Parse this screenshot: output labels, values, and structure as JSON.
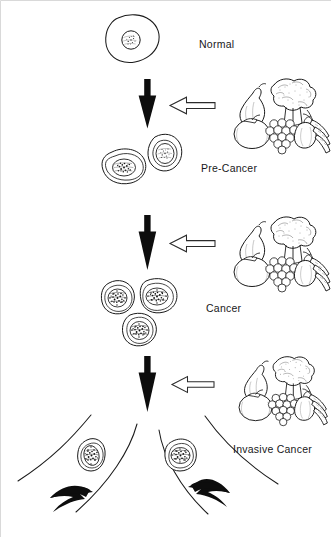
{
  "figure": {
    "width": 331,
    "height": 537,
    "background_color": "#ffffff",
    "ink_color": "#111111",
    "border_color": "#d9d9d9"
  },
  "stages": [
    {
      "id": "normal",
      "label": "Normal",
      "cell_count": 1,
      "cell_description": "single normal cell with round nucleus",
      "label_x": 199,
      "label_y": 39
    },
    {
      "id": "pre-cancer",
      "label": "Pre-Cancer",
      "cell_count": 2,
      "cell_description": "two cells with irregular speckled nuclei",
      "label_x": 201,
      "label_y": 163
    },
    {
      "id": "cancer",
      "label": "Cancer",
      "cell_count": 3,
      "cell_description": "three cells with dense dark irregular nuclei",
      "label_x": 206,
      "label_y": 303
    },
    {
      "id": "invasive-cancer",
      "label": "Invasive Cancer",
      "cell_count": 2,
      "cell_description": "two cells migrating outward through diverging channels",
      "label_x": 233,
      "label_y": 444
    }
  ],
  "progression_arrows": [
    {
      "id": "arrow-normal-to-precancer",
      "icon": "down-arrow-icon",
      "direction": "down",
      "style": "solid-black"
    },
    {
      "id": "arrow-precancer-to-cancer",
      "icon": "down-arrow-icon",
      "direction": "down",
      "style": "solid-black"
    },
    {
      "id": "arrow-cancer-to-invasive",
      "icon": "down-arrow-icon",
      "direction": "down",
      "style": "solid-black"
    }
  ],
  "intervention_arrows": [
    {
      "id": "diet-arrow-1",
      "icon": "left-arrow-outline-icon",
      "direction": "left",
      "style": "hollow-outline"
    },
    {
      "id": "diet-arrow-2",
      "icon": "left-arrow-outline-icon",
      "direction": "left",
      "style": "hollow-outline"
    },
    {
      "id": "diet-arrow-3",
      "icon": "left-arrow-outline-icon",
      "direction": "left",
      "style": "hollow-outline"
    }
  ],
  "food_clusters": [
    {
      "id": "food-cluster-1",
      "icon": "fruits-vegetables-icon",
      "items": [
        "broccoli",
        "pear",
        "tomato",
        "grapes",
        "squash",
        "carrots"
      ]
    },
    {
      "id": "food-cluster-2",
      "icon": "fruits-vegetables-icon",
      "items": [
        "broccoli",
        "pear",
        "tomato",
        "grapes",
        "squash",
        "carrots"
      ]
    },
    {
      "id": "food-cluster-3",
      "icon": "fruits-vegetables-icon",
      "items": [
        "broccoli",
        "pear",
        "tomato",
        "grapes",
        "squash",
        "carrots"
      ]
    }
  ],
  "invasion_arrows": [
    {
      "id": "invasion-arrow-left",
      "icon": "curved-arrow-icon",
      "direction": "down-left",
      "style": "solid-black-curved"
    },
    {
      "id": "invasion-arrow-right",
      "icon": "curved-arrow-icon",
      "direction": "down-right",
      "style": "solid-black-curved"
    }
  ]
}
